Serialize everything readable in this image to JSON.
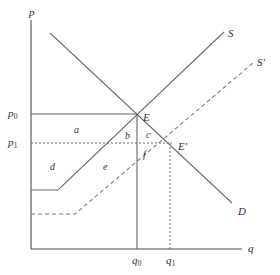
{
  "figure": {
    "type": "supply-demand-diagram",
    "background_color": "#ffffff",
    "line_color": "#6b6b6b",
    "text_color": "#2f2f2f",
    "width": 280,
    "height": 275
  },
  "axes": {
    "y_axis_label": "p",
    "x_axis_label": "q",
    "y_axis": {
      "x": 31,
      "y_top": 20,
      "y_bottom": 249
    },
    "x_axis": {
      "y": 249,
      "x_left": 31,
      "x_right": 242
    }
  },
  "price_ticks": [
    {
      "id": "p0",
      "label": "p",
      "subscript": "0",
      "y": 114,
      "line_style": "solid",
      "x_end": 137
    },
    {
      "id": "p1",
      "label": "p",
      "subscript": "1",
      "y": 143,
      "line_style": "dotted",
      "x_end": 172
    }
  ],
  "quantity_ticks": [
    {
      "id": "q0",
      "label": "q",
      "subscript": "0",
      "x": 137,
      "line_style": "solid",
      "y_top": 114
    },
    {
      "id": "q1",
      "label": "q",
      "subscript": "1",
      "x": 170,
      "line_style": "dotted",
      "y_top": 143
    }
  ],
  "curves": [
    {
      "id": "demand",
      "label": "D",
      "style": "solid",
      "label_x": 238,
      "label_y": 206,
      "points": "50,33 232,203"
    },
    {
      "id": "supply",
      "label": "S",
      "style": "solid",
      "label_x": 228,
      "label_y": 28,
      "points": "31,190 58,190 224,32"
    },
    {
      "id": "supply-shifted",
      "label": "S'",
      "style": "dashed",
      "label_x": 257,
      "label_y": 57,
      "points": "31,214 75,214 253,63"
    }
  ],
  "points": [
    {
      "id": "E",
      "label": "E",
      "x": 137,
      "y": 114,
      "label_x": 143,
      "label_y": 112
    },
    {
      "id": "E-prime",
      "label": "E'",
      "x": 172,
      "y": 143,
      "label_x": 178,
      "label_y": 141
    }
  ],
  "regions": [
    {
      "id": "a",
      "label": "a",
      "x": 74,
      "y": 125
    },
    {
      "id": "b",
      "label": "b",
      "x": 125,
      "y": 131
    },
    {
      "id": "c",
      "label": "c",
      "x": 146,
      "y": 130
    },
    {
      "id": "d",
      "label": "d",
      "x": 50,
      "y": 162
    },
    {
      "id": "e",
      "label": "e",
      "x": 103,
      "y": 162
    },
    {
      "id": "f",
      "label": "f",
      "x": 143,
      "y": 150
    }
  ],
  "chart_data": {
    "type": "line",
    "title": "",
    "xlabel": "q",
    "ylabel": "p",
    "grid": false,
    "legend": "inline-curve-labels",
    "series": [
      {
        "name": "D",
        "style": "solid",
        "kind": "demand",
        "points": [
          [
            50,
            33
          ],
          [
            232,
            203
          ]
        ]
      },
      {
        "name": "S",
        "style": "solid",
        "kind": "supply-original",
        "points": [
          [
            31,
            190
          ],
          [
            58,
            190
          ],
          [
            224,
            32
          ]
        ]
      },
      {
        "name": "S'",
        "style": "dashed",
        "kind": "supply-shifted",
        "points": [
          [
            31,
            214
          ],
          [
            75,
            214
          ],
          [
            253,
            63
          ]
        ]
      }
    ],
    "equilibria": [
      {
        "name": "E",
        "price": "p0",
        "quantity": "q0",
        "pixel": [
          137,
          114
        ]
      },
      {
        "name": "E'",
        "price": "p1",
        "quantity": "q1",
        "pixel": [
          172,
          143
        ]
      }
    ],
    "annotations": [
      "a",
      "b",
      "c",
      "d",
      "e",
      "f"
    ],
    "axis_tick_labels": {
      "y": [
        "p0",
        "p1"
      ],
      "x": [
        "q0",
        "q1"
      ]
    }
  }
}
